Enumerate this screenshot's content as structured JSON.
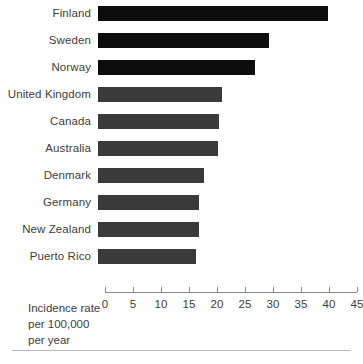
{
  "chart_data": {
    "type": "bar",
    "orientation": "horizontal",
    "title": "",
    "subtitle": "",
    "xlabel": "Incidence rate per 100,000 per year",
    "ylabel": "",
    "xlim": [
      0,
      45
    ],
    "xticks": [
      0,
      5,
      10,
      15,
      20,
      25,
      30,
      35,
      40,
      45
    ],
    "xticklabels": [
      "0",
      "5",
      "10",
      "15",
      "20",
      "25",
      "30",
      "35",
      "40",
      "45"
    ],
    "grid": false,
    "legend": null,
    "categories": [
      "Finland",
      "Sweden",
      "Norway",
      "United Kingdom",
      "Canada",
      "Australia",
      "Denmark",
      "Germany",
      "New Zealand",
      "Puerto Rico"
    ],
    "values": [
      41,
      30.5,
      28,
      22.2,
      21.6,
      21.4,
      19,
      18.1,
      18,
      17.5
    ],
    "bar_colors": [
      "#0d0d0d",
      "#0d0d0d",
      "#0d0d0d",
      "#3a3a3a",
      "#3a3a3a",
      "#3a3a3a",
      "#3a3a3a",
      "#3a3a3a",
      "#3a3a3a",
      "#3a3a3a"
    ]
  },
  "axis_caption": {
    "line1": "Incidence rate",
    "line2": "per 100,000",
    "line3": "per year"
  },
  "colors": {
    "background": "#ffffff",
    "text": "#3d3d3d",
    "axis": "#8a8a8a",
    "rule": "#b9b9b9",
    "bar_dark": "#0d0d0d",
    "bar_gray": "#3a3a3a"
  }
}
